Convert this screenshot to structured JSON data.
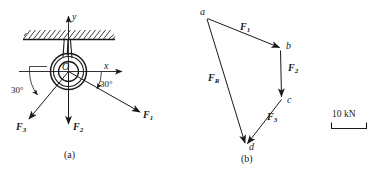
{
  "figure": {
    "background_color": "#ffffff",
    "line_color": "#1a1a1a",
    "panels": [
      {
        "id": "panel-a",
        "caption": "(a)",
        "description": "ring supported from hatched ceiling with three applied forces",
        "center_label": "O",
        "axis_x_label": "x",
        "axis_y_label": "y",
        "angle_right": "30°",
        "angle_left": "30°",
        "force_labels": [
          {
            "name": "F1",
            "base": "F",
            "sub": "1"
          },
          {
            "name": "F2",
            "base": "F",
            "sub": "2"
          },
          {
            "name": "F3",
            "base": "F",
            "sub": "3"
          }
        ]
      },
      {
        "id": "panel-b",
        "caption": "(b)",
        "description": "force polygon a-b-c-d with resultant",
        "vertex_labels": [
          "a",
          "b",
          "c",
          "d"
        ],
        "force_labels": [
          {
            "name": "F1",
            "base": "F",
            "sub": "1"
          },
          {
            "name": "F2",
            "base": "F",
            "sub": "2"
          },
          {
            "name": "F3",
            "base": "F",
            "sub": "3"
          },
          {
            "name": "FR",
            "base": "F",
            "sub": "R"
          }
        ]
      }
    ],
    "scale_bar": {
      "label": "10 kN",
      "name": "scale-bar"
    }
  }
}
